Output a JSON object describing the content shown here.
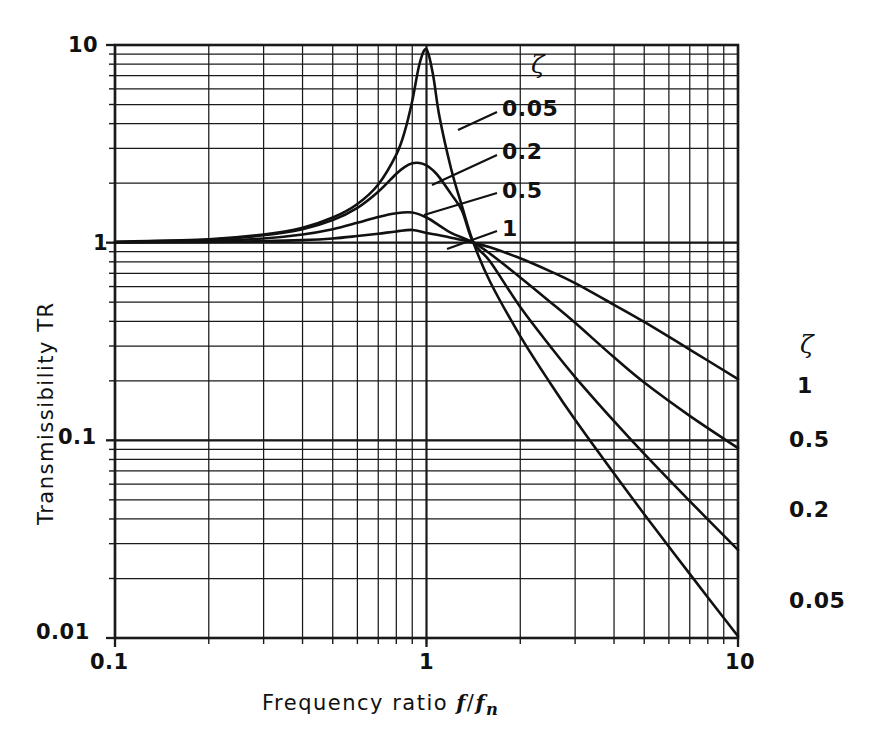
{
  "chart_data": {
    "type": "line",
    "title": "",
    "xlabel": "Frequency ratio f/fn",
    "ylabel": "Transmissibility TR",
    "xscale": "log",
    "yscale": "log",
    "xlim": [
      0.1,
      10
    ],
    "ylim": [
      0.01,
      10
    ],
    "grid": true,
    "grid_style": "log-log minor gridlines, both axes",
    "x_tick_labels": [
      "0.1",
      "1",
      "10"
    ],
    "x_tick_values": [
      0.1,
      1,
      10
    ],
    "y_tick_labels": [
      "0.01",
      "0.1",
      "1",
      "10"
    ],
    "y_tick_values": [
      0.01,
      0.1,
      1,
      10
    ],
    "legend_title": "ζ",
    "legend_position": "inside-top-right and outside-right",
    "series": [
      {
        "name": "0.05",
        "zeta": 0.05,
        "label_left": "0.05",
        "label_right": "0.05",
        "peak_x": 1.0,
        "peak_y": 9.5,
        "end_y": 0.0145,
        "points_x": [
          0.1,
          0.2,
          0.3,
          0.4,
          0.5,
          0.6,
          0.7,
          0.8,
          0.85,
          0.9,
          0.95,
          1.0,
          1.05,
          1.1,
          1.2,
          1.3,
          1.414,
          1.6,
          2.0,
          2.5,
          3.0,
          4.0,
          5.0,
          7.0,
          10.0
        ],
        "points_y": [
          1.01,
          1.04,
          1.1,
          1.19,
          1.34,
          1.57,
          1.97,
          2.79,
          3.62,
          5.21,
          8.04,
          9.51,
          7.03,
          4.36,
          2.36,
          1.53,
          1.0,
          0.634,
          0.337,
          0.194,
          0.127,
          0.0679,
          0.0423,
          0.0211,
          0.0102
        ]
      },
      {
        "name": "0.2",
        "zeta": 0.2,
        "label_left": "0.2",
        "label_right": "0.2",
        "peak_x": 0.96,
        "peak_y": 2.55,
        "end_y": 0.045,
        "points_x": [
          0.1,
          0.2,
          0.3,
          0.4,
          0.5,
          0.6,
          0.7,
          0.8,
          0.85,
          0.9,
          0.95,
          1.0,
          1.05,
          1.1,
          1.2,
          1.3,
          1.414,
          1.6,
          2.0,
          2.5,
          3.0,
          4.0,
          5.0,
          7.0,
          10.0
        ],
        "points_y": [
          1.008,
          1.035,
          1.09,
          1.17,
          1.3,
          1.5,
          1.81,
          2.23,
          2.41,
          2.52,
          2.53,
          2.46,
          2.32,
          2.14,
          1.76,
          1.45,
          1.0,
          0.803,
          0.472,
          0.298,
          0.209,
          0.125,
          0.0854,
          0.0493,
          0.0279
        ]
      },
      {
        "name": "0.5",
        "zeta": 0.5,
        "label_left": "0.5",
        "label_right": "0.5",
        "peak_x": 0.84,
        "peak_y": 1.43,
        "end_y": 0.11,
        "points_x": [
          0.1,
          0.2,
          0.3,
          0.4,
          0.5,
          0.6,
          0.7,
          0.8,
          0.9,
          1.0,
          1.1,
          1.2,
          1.414,
          1.6,
          2.0,
          2.5,
          3.0,
          4.0,
          5.0,
          7.0,
          10.0
        ],
        "points_y": [
          1.005,
          1.02,
          1.05,
          1.1,
          1.17,
          1.26,
          1.35,
          1.41,
          1.42,
          1.34,
          1.22,
          1.12,
          1.0,
          0.879,
          0.667,
          0.5,
          0.393,
          0.263,
          0.196,
          0.133,
          0.0914
        ]
      },
      {
        "name": "1",
        "zeta": 1,
        "label_left": "1",
        "label_right": "1",
        "peak_x": 0.9,
        "peak_y": 1.16,
        "end_y": 0.2,
        "points_x": [
          0.1,
          0.2,
          0.3,
          0.4,
          0.5,
          0.6,
          0.7,
          0.8,
          0.9,
          1.0,
          1.1,
          1.2,
          1.414,
          1.6,
          2.0,
          2.5,
          3.0,
          4.0,
          5.0,
          7.0,
          10.0
        ],
        "points_y": [
          1.002,
          1.008,
          1.017,
          1.03,
          1.05,
          1.08,
          1.11,
          1.14,
          1.16,
          1.12,
          1.09,
          1.06,
          1.0,
          0.947,
          0.834,
          0.716,
          0.624,
          0.485,
          0.397,
          0.288,
          0.204
        ]
      }
    ],
    "annotations": [
      {
        "text": "ζ",
        "role": "legend-title-top"
      },
      {
        "text": "ζ",
        "role": "legend-title-right"
      }
    ]
  },
  "axes": {
    "y_title": "Transmissibility TR",
    "x_title_prefix": "Frequency ratio ",
    "x_title_f1": "f",
    "x_title_slash": "/",
    "x_title_f2": "f",
    "x_title_sub": "n",
    "y_ticks": [
      {
        "label": "10",
        "value": 10
      },
      {
        "label": "1",
        "value": 1
      },
      {
        "label": "0.1",
        "value": 0.1
      },
      {
        "label": "0.01",
        "value": 0.01
      }
    ],
    "x_ticks": [
      {
        "label": "0.1",
        "value": 0.1
      },
      {
        "label": "1",
        "value": 1
      },
      {
        "label": "10",
        "value": 10
      }
    ]
  },
  "legend_top": {
    "title": "ζ",
    "items": [
      "0.05",
      "0.2",
      "0.5",
      "1"
    ]
  },
  "legend_right": {
    "title": "ζ",
    "items": [
      "1",
      "0.5",
      "0.2",
      "0.05"
    ]
  },
  "style": {
    "line_color": "#111111",
    "grid_color": "#1a1a1a",
    "background": "#ffffff"
  }
}
